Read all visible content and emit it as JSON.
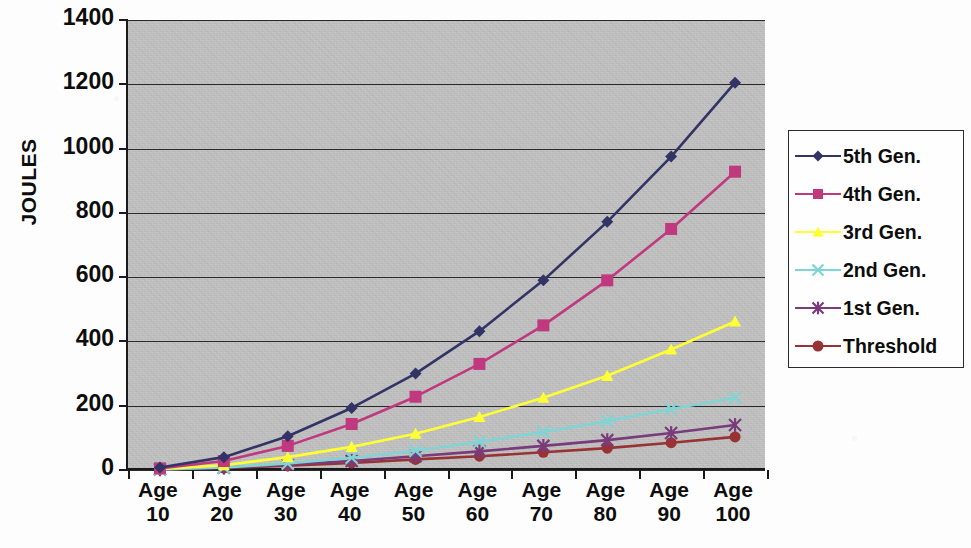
{
  "chart_data": {
    "type": "line",
    "title": "",
    "xlabel": "",
    "ylabel": "JOULES",
    "categories": [
      "Age 10",
      "Age 20",
      "Age 30",
      "Age 40",
      "Age 50",
      "Age 60",
      "Age 70",
      "Age 80",
      "Age 90",
      "Age 100"
    ],
    "category_lines": [
      {
        "l1": "Age",
        "l2": "10"
      },
      {
        "l1": "Age",
        "l2": "20"
      },
      {
        "l1": "Age",
        "l2": "30"
      },
      {
        "l1": "Age",
        "l2": "40"
      },
      {
        "l1": "Age",
        "l2": "50"
      },
      {
        "l1": "Age",
        "l2": "60"
      },
      {
        "l1": "Age",
        "l2": "70"
      },
      {
        "l1": "Age",
        "l2": "80"
      },
      {
        "l1": "Age",
        "l2": "90"
      },
      {
        "l1": "Age",
        "l2": "100"
      }
    ],
    "ylim": [
      0,
      1400
    ],
    "yticks": [
      0,
      200,
      400,
      600,
      800,
      1000,
      1200,
      1400
    ],
    "ytick_labels": [
      "0",
      "200",
      "400",
      "600",
      "800",
      "1000",
      "1200",
      "1400"
    ],
    "grid": true,
    "legend_position": "right",
    "plot_background": "#c3c3c3",
    "series": [
      {
        "name": "5th Gen.",
        "color": "#333366",
        "marker": "diamond",
        "values": [
          8,
          40,
          105,
          193,
          300,
          432,
          590,
          772,
          975,
          1205
        ]
      },
      {
        "name": "4th Gen.",
        "color": "#c0397f",
        "marker": "square",
        "values": [
          5,
          28,
          75,
          143,
          228,
          330,
          450,
          590,
          750,
          928
        ]
      },
      {
        "name": "3rd Gen.",
        "color": "#ffff33",
        "marker": "triangle",
        "values": [
          3,
          15,
          40,
          72,
          113,
          165,
          225,
          293,
          375,
          462
        ]
      },
      {
        "name": "2nd Gen.",
        "color": "#7fd5d5",
        "marker": "x",
        "values": [
          2,
          8,
          20,
          38,
          60,
          88,
          118,
          152,
          190,
          225
        ]
      },
      {
        "name": "1st Gen.",
        "color": "#7a3b7a",
        "marker": "asterisk",
        "values": [
          2,
          7,
          17,
          28,
          43,
          58,
          75,
          93,
          115,
          140
        ]
      },
      {
        "name": "Threshold",
        "color": "#993333",
        "marker": "circle",
        "values": [
          2,
          6,
          13,
          22,
          33,
          43,
          55,
          68,
          85,
          103
        ]
      }
    ]
  }
}
